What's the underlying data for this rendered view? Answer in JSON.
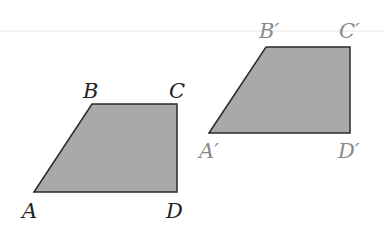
{
  "colors": {
    "background": "#ffffff",
    "fill": "#a9a9a9",
    "stroke": "#2a2a2a",
    "label_original": "#222222",
    "label_image": "#8a8a8a",
    "guide_line": "#e6e6e6"
  },
  "original": {
    "labels": {
      "A": "A",
      "B": "B",
      "C": "C",
      "D": "D"
    }
  },
  "image": {
    "labels": {
      "A": "A′",
      "B": "B′",
      "C": "C′",
      "D": "D′"
    }
  }
}
